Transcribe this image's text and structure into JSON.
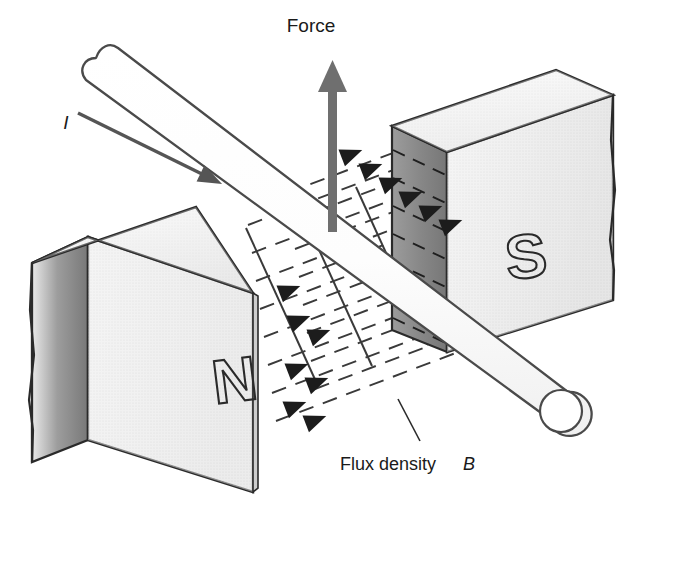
{
  "figure": {
    "background_color": "#ffffff",
    "ink_color": "#2a2a2a"
  },
  "labels": {
    "force": "Force",
    "current": "I",
    "flux_density_text": "Flux density",
    "flux_density_symbol": "B",
    "north_pole": "N",
    "south_pole": "S"
  },
  "colors": {
    "outline": "#2a2a2a",
    "magnet_top_face": "#efefef",
    "magnet_front_face": "#e4e4e4",
    "magnet_side_shadow": "#9a9a9a",
    "pole_face_shaded": "#8d8d8d",
    "field_line": "#3a3a3a",
    "force_arrow": "#6f6f6f",
    "current_arrow": "#555555",
    "conductor_stroke": "#4a4a4a",
    "conductor_fill": "#ffffff"
  },
  "elements": {
    "force_arrow": {
      "direction": "up",
      "tip_y": 62,
      "tail_y": 232,
      "x": 333
    },
    "current_arrow": {
      "direction": "down-right",
      "from": [
        78,
        113
      ],
      "to": [
        222,
        184
      ]
    },
    "conductor": {
      "shape": "rod",
      "left_end": "rounded-cap",
      "right_end": "open-circle"
    },
    "field_lines": {
      "style": "dashed",
      "direction": "left-to-right, N to S",
      "arrowhead_count": 12
    },
    "magnets": [
      {
        "pole": "N",
        "position": "lower-left",
        "pole_face": "right"
      },
      {
        "pole": "S",
        "position": "upper-right",
        "pole_face": "left",
        "shaded": true
      }
    ]
  }
}
